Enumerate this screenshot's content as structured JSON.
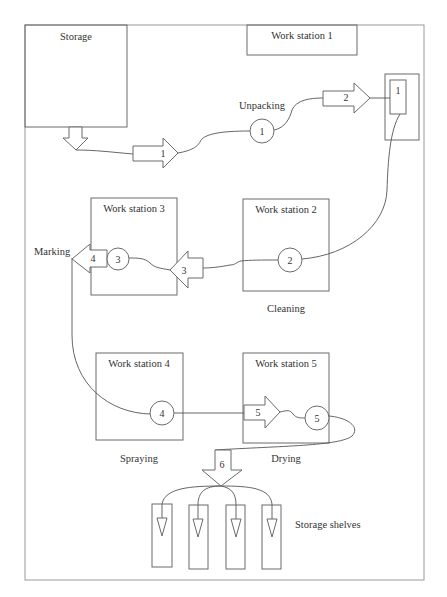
{
  "diagram": {
    "type": "process-flow-layout",
    "colors": {
      "stroke": "#6b6b6b",
      "frame": "#9a9a9a",
      "text": "#333333",
      "background": "#ffffff"
    },
    "areas": {
      "storage": "Storage",
      "ws1": "Work station 1",
      "ws2": "Work station 2",
      "ws3": "Work station 3",
      "ws4": "Work station 4",
      "ws5": "Work station 5",
      "shelves": "Storage shelves"
    },
    "operations": {
      "unpacking": "Unpacking",
      "cleaning": "Cleaning",
      "marking": "Marking",
      "spraying": "Spraying",
      "drying": "Drying"
    },
    "nodes": {
      "n1": "1",
      "n2": "2",
      "n3": "3",
      "n4": "4",
      "n5": "5"
    },
    "rack": {
      "label": "1"
    },
    "transports": {
      "t1": "1",
      "t2": "2",
      "t3": "3",
      "t4": "4",
      "t5": "5",
      "t6": "6"
    }
  }
}
